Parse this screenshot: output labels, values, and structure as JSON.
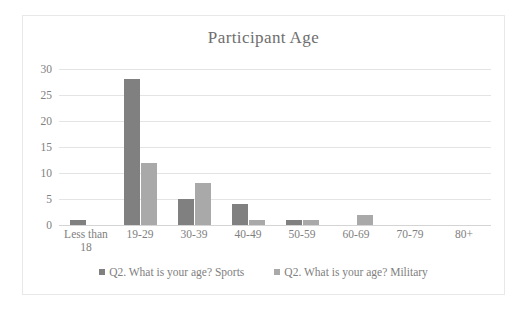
{
  "chart_data": {
    "type": "bar",
    "title": "Participant Age",
    "xlabel": "",
    "ylabel": "",
    "ylim": [
      0,
      30
    ],
    "yticks": [
      0,
      5,
      10,
      15,
      20,
      25,
      30
    ],
    "grid": true,
    "legend_position": "bottom",
    "categories": [
      "Less than 18",
      "19-29",
      "30-39",
      "40-49",
      "50-59",
      "60-69",
      "70-79",
      "80+"
    ],
    "series": [
      {
        "name": "Q2. What is your age? Sports",
        "color": "#808080",
        "values": [
          1,
          28,
          5,
          4,
          1,
          0,
          0,
          0
        ]
      },
      {
        "name": "Q2. What is your age? Military",
        "color": "#a9a9a9",
        "values": [
          0,
          12,
          8,
          1,
          1,
          2,
          0,
          0
        ]
      }
    ]
  },
  "frame": {
    "border_color": "#e8e8e8",
    "background": "#ffffff"
  }
}
